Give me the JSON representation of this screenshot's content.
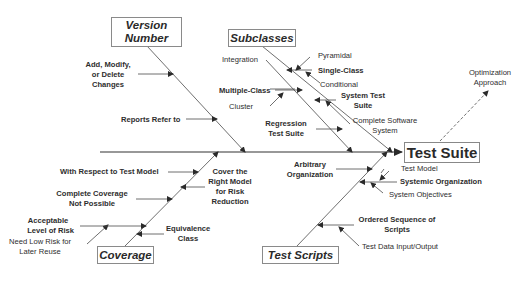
{
  "diagram": {
    "type": "fishbone",
    "effect": "Test Suite",
    "categories": [
      {
        "name": "Version Number",
        "causes": [
          {
            "text": "Add, Modify, or Delete Changes",
            "lines": [
              "Add, Modify,",
              "or Delete",
              "Changes"
            ],
            "bold": true
          },
          {
            "text": "Reports Refer to",
            "bold": true
          }
        ]
      },
      {
        "name": "Subclasses",
        "causes": [
          {
            "text": "Integration",
            "bold": false
          },
          {
            "text": "Pyramidal",
            "bold": false
          },
          {
            "text": "Single-Class",
            "bold": true
          },
          {
            "text": "Conditional",
            "bold": false
          },
          {
            "text": "Multiple-Class",
            "bold": true
          },
          {
            "text": "Cluster",
            "bold": false
          },
          {
            "text": "System Test Suite",
            "lines": [
              "System Test",
              "Suite"
            ],
            "bold": true
          },
          {
            "text": "Complete Software System",
            "lines": [
              "Complete Software",
              "System"
            ],
            "bold": false
          },
          {
            "text": "Regression Test Suite",
            "lines": [
              "Regression",
              "Test Suite"
            ],
            "bold": true
          }
        ]
      },
      {
        "name": "Coverage",
        "causes": [
          {
            "text": "With Respect to Test Model",
            "bold": true
          },
          {
            "text": "Complete Coverage Not Possible",
            "lines": [
              "Complete Coverage",
              "Not Possible"
            ],
            "bold": true
          },
          {
            "text": "Acceptable Level of Risk",
            "lines": [
              "Acceptable",
              "Level of Risk"
            ],
            "bold": true
          },
          {
            "text": "Need Low Risk for Later Reuse",
            "lines": [
              "Need Low Risk for",
              "Later Reuse"
            ],
            "bold": false
          },
          {
            "text": "Equivalence Class",
            "lines": [
              "Equivalence",
              "Class"
            ],
            "bold": true
          },
          {
            "text": "Cover the Right Model for Risk Reduction",
            "lines": [
              "Cover the",
              "Right Model",
              "for Risk",
              "Reduction"
            ],
            "bold": true
          }
        ]
      },
      {
        "name": "Test Scripts",
        "causes": [
          {
            "text": "Arbitrary Organization",
            "lines": [
              "Arbitrary",
              "Organization"
            ],
            "bold": true
          },
          {
            "text": "Test Model",
            "bold": false
          },
          {
            "text": "Systemic Organization",
            "bold": true
          },
          {
            "text": "System Objectives",
            "bold": false
          },
          {
            "text": "Ordered Sequence of Scripts",
            "lines": [
              "Ordered Sequence of",
              "Scripts"
            ],
            "bold": true
          },
          {
            "text": "Test Data Input/Output",
            "bold": false
          }
        ]
      }
    ],
    "extra": {
      "text": "Optimization Approach",
      "lines": [
        "Optimization",
        "Approach"
      ],
      "style": "dashed-arrow"
    }
  },
  "boxes": {
    "version_number": [
      "Version",
      "Number"
    ],
    "subclasses": "Subclasses",
    "coverage": "Coverage",
    "test_scripts": "Test Scripts",
    "test_suite": "Test Suite"
  },
  "labels": {
    "add_modify": [
      "Add, Modify,",
      "or Delete",
      "Changes"
    ],
    "reports_refer": "Reports Refer to",
    "integration": "Integration",
    "pyramidal": "Pyramidal",
    "single_class": "Single-Class",
    "conditional": "Conditional",
    "multiple_class": "Multiple-Class",
    "cluster": "Cluster",
    "system_test_suite": [
      "System Test",
      "Suite"
    ],
    "complete_software": [
      "Complete Software",
      "System"
    ],
    "regression": [
      "Regression",
      "Test Suite"
    ],
    "optimization": [
      "Optimization",
      "Approach"
    ],
    "with_respect": "With Respect to Test Model",
    "complete_coverage": [
      "Complete Coverage",
      "Not Possible"
    ],
    "acceptable": [
      "Acceptable",
      "Level of Risk"
    ],
    "need_low_risk": [
      "Need Low Risk for",
      "Later Reuse"
    ],
    "equivalence": [
      "Equivalence",
      "Class"
    ],
    "cover_right": [
      "Cover the",
      "Right Model",
      "for Risk",
      "Reduction"
    ],
    "arbitrary": [
      "Arbitrary",
      "Organization"
    ],
    "test_model": "Test Model",
    "systemic": "Systemic Organization",
    "system_objectives": "System Objectives",
    "ordered": [
      "Ordered Sequence of",
      "Scripts"
    ],
    "test_data": "Test Data Input/Output"
  },
  "colors": {
    "line": "#3a3a3a",
    "box_border": "#8a8a8a",
    "text": "#2a2a2a"
  }
}
